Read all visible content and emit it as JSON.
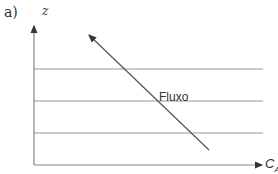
{
  "panel_label": "a)",
  "axes": {
    "y_label": "z",
    "x_label_main": "C",
    "x_label_sub": "A"
  },
  "arrow_label": "Fluxo",
  "horizontal_lines": 3,
  "colors": {
    "lines": "#888888",
    "text": "#333333"
  }
}
